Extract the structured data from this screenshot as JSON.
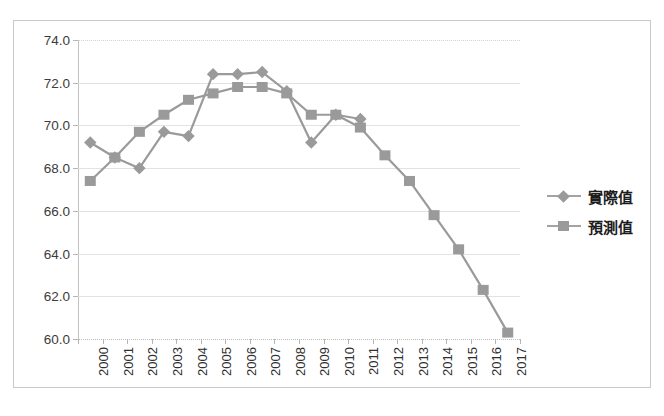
{
  "chart_data": {
    "type": "line",
    "title": "",
    "xlabel": "",
    "ylabel": "",
    "ylim": [
      60.0,
      74.0
    ],
    "ytick_step": 2.0,
    "ytick_labels": [
      "74.0",
      "72.0",
      "70.0",
      "68.0",
      "66.0",
      "64.0",
      "62.0",
      "60.0"
    ],
    "yticks": [
      74.0,
      72.0,
      70.0,
      68.0,
      66.0,
      64.0,
      62.0,
      60.0
    ],
    "grid": true,
    "legend_position": "right",
    "categories": [
      "2000",
      "2001",
      "2002",
      "2003",
      "2004",
      "2005",
      "2006",
      "2007",
      "2008",
      "2009",
      "2010",
      "2011",
      "2012",
      "2013",
      "2014",
      "2015",
      "2016",
      "2017"
    ],
    "series": [
      {
        "name": "實際值",
        "marker": "diamond",
        "color": "#9a9a9a",
        "values": [
          69.2,
          68.5,
          68.0,
          69.7,
          69.5,
          72.4,
          72.4,
          72.5,
          71.6,
          69.2,
          70.5,
          70.3,
          null,
          null,
          null,
          null,
          null,
          null
        ]
      },
      {
        "name": "預測值",
        "marker": "square",
        "color": "#9a9a9a",
        "values": [
          67.4,
          68.5,
          69.7,
          70.5,
          71.2,
          71.5,
          71.8,
          71.8,
          71.5,
          70.5,
          70.5,
          69.9,
          68.6,
          67.4,
          65.8,
          64.2,
          62.3,
          60.3
        ]
      }
    ]
  },
  "legend": {
    "items": [
      {
        "label": "實際值",
        "marker": "diamond"
      },
      {
        "label": "預測值",
        "marker": "square"
      }
    ]
  }
}
